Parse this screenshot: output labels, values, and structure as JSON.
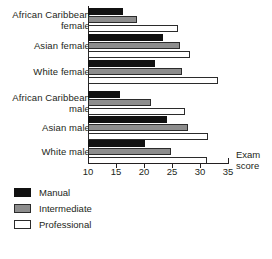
{
  "chart_data": {
    "type": "bar",
    "orientation": "horizontal",
    "title": "",
    "xlabel": "Exam score",
    "ylabel": "",
    "xlim": [
      10,
      35
    ],
    "xticks": [
      10,
      15,
      20,
      25,
      30,
      35
    ],
    "grid": false,
    "legend_position": "bottom-left",
    "categories": [
      "African Caribbean\nfemale",
      "Asian female",
      "White female",
      "African Caribbean\nmale",
      "Asian male",
      "White male"
    ],
    "series": [
      {
        "name": "Manual",
        "color": "#111111",
        "values": [
          16.3,
          23.4,
          21.9,
          15.7,
          24.1,
          20.1
        ]
      },
      {
        "name": "Intermediate",
        "color": "#8d8d8d",
        "values": [
          18.7,
          26.4,
          26.7,
          21.3,
          27.8,
          24.9
        ]
      },
      {
        "name": "Professional",
        "color": "#ffffff",
        "values": [
          26.0,
          28.2,
          33.2,
          27.4,
          31.5,
          31.2
        ]
      }
    ]
  },
  "axis": {
    "title_line1": "Exam",
    "title_line2": "score",
    "tick_labels": [
      "10",
      "15",
      "20",
      "25",
      "30",
      "35"
    ]
  },
  "legend": {
    "items": [
      {
        "label": "Manual",
        "swatch": "manual"
      },
      {
        "label": "Intermediate",
        "swatch": "intermediate"
      },
      {
        "label": "Professional",
        "swatch": "professional"
      }
    ]
  }
}
